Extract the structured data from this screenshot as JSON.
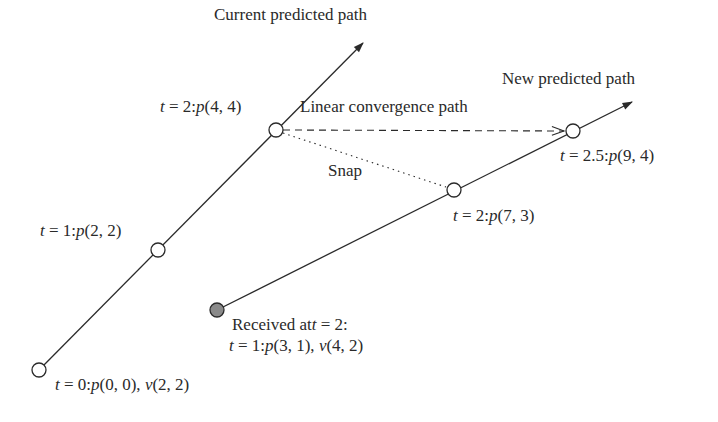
{
  "diagram": {
    "title_current": "Current predicted path",
    "title_new": "New predicted path",
    "convergence_label": "Linear convergence path",
    "snap_label": "Snap",
    "colors": {
      "line": "#2a2a2a",
      "received_fill": "#8a8a8a",
      "background": "#ffffff"
    },
    "current_path": {
      "points": [
        {
          "t": "0",
          "label_t": "t",
          "label_rest": " = 0:",
          "p": "p",
          "coords": "(0, 0), ",
          "v": "v",
          "vcoords": "(2, 2)"
        },
        {
          "t": "1",
          "label_t": "t",
          "label_rest": " = 1:",
          "p": "p",
          "coords": "(2, 2)"
        },
        {
          "t": "2",
          "label_t": "t",
          "label_rest": " = 2:",
          "p": "p",
          "coords": "(4, 4)"
        }
      ]
    },
    "new_path": {
      "received": {
        "line1": "Received at",
        "line1_t": "t",
        "line1_rest": " = 2:",
        "line2_t": "t",
        "line2_rest": " = 1:",
        "p": "p",
        "coords": "(3, 1), ",
        "v": "v",
        "vcoords": "(4, 2)"
      },
      "points": [
        {
          "t": "2",
          "label_t": "t",
          "label_rest": " = 2:",
          "p": "p",
          "coords": "(7, 3)"
        },
        {
          "t": "2.5",
          "label_t": "t",
          "label_rest": " = 2.5:",
          "p": "p",
          "coords": "(9, 4)"
        }
      ]
    }
  }
}
